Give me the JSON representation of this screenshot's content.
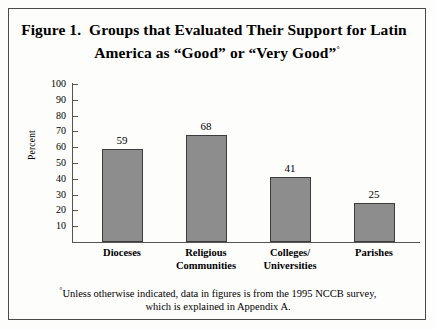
{
  "figure": {
    "title_line_1": "Figure 1.  Groups that Evaluated Their Support for Latin",
    "title_line_2": "America as “Good” or “Very Good”",
    "title_footnote_marker": "°",
    "footnote_marker": "°",
    "footnote_text": "Unless otherwise indicated, data in figures is from the 1995 NCCB survey, which is explained in Appendix A.",
    "frame_color": "#4a4a4a",
    "bar_fill_color": "#8d8d8d",
    "bar_border_color": "#3d3d3d",
    "axis_color": "#555555"
  },
  "chart_data": {
    "type": "bar",
    "title": "Figure 1.  Groups that Evaluated Their Support for Latin America as “Good” or “Very Good”",
    "categories": [
      "Dioceses",
      "Religious Communities",
      "Colleges/ Universities",
      "Parishes"
    ],
    "category_lines": [
      [
        "Dioceses"
      ],
      [
        "Religious",
        "Communities"
      ],
      [
        "Colleges/",
        "Universities"
      ],
      [
        "Parishes"
      ]
    ],
    "values": [
      59,
      68,
      41,
      25
    ],
    "value_labels": [
      "59",
      "68",
      "41",
      "25"
    ],
    "xlabel": "",
    "ylabel": "Percent",
    "ylim": [
      0,
      100
    ],
    "yticks": [
      100,
      90,
      80,
      70,
      60,
      50,
      40,
      30,
      20,
      10
    ],
    "ytick_labels": [
      "100",
      "90",
      "80",
      "70",
      "60",
      "50",
      "40",
      "30",
      "20",
      "10"
    ],
    "grid": false,
    "legend": false
  }
}
